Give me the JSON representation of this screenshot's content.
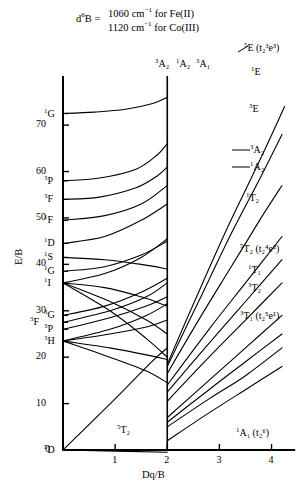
{
  "header": {
    "prefix": "d6B",
    "prefix_super": "6",
    "eq": "=",
    "line1": "1060 cm",
    "line1_sup": "−1",
    "line1_tail": " for Fe(II)",
    "line2": "1120 cm",
    "line2_sup": "−1",
    "line2_tail": " for Co(III)"
  },
  "axes": {
    "ylabel": "E/B",
    "xlabel": "Dq/B",
    "yticks": [
      0,
      10,
      20,
      30,
      40,
      50,
      60,
      70
    ],
    "ytick_labels": [
      "0",
      "10",
      "20",
      "30",
      "40",
      "50",
      "60",
      "70"
    ],
    "xticks": [
      1,
      2,
      3,
      4
    ],
    "xtick_labels": [
      "1",
      "2",
      "3",
      "4"
    ],
    "ylim": [
      0,
      78
    ],
    "xlim": [
      0,
      4.45
    ],
    "crossover_x": 2.0,
    "grid": false
  },
  "free_ion_terms": [
    {
      "label": "1G",
      "super": "1",
      "letter": "G",
      "value": 72.5
    },
    {
      "label": "3P",
      "super": "3",
      "letter": "P",
      "value": 58.0
    },
    {
      "label": "3F",
      "super": "3",
      "letter": "F",
      "value": 54.0
    },
    {
      "label": "1F",
      "super": "1",
      "letter": "F",
      "value": 49.5
    },
    {
      "label": "1D",
      "super": "1",
      "letter": "D",
      "value": 44.5
    },
    {
      "label": "1S",
      "super": "1",
      "letter": "S",
      "value": 41.5
    },
    {
      "label": "1G",
      "super": "1",
      "letter": "G",
      "value": 38.5
    },
    {
      "label": "1I",
      "super": "1",
      "letter": "I",
      "value": 36.0
    },
    {
      "label": "3G",
      "super": "3",
      "letter": "G",
      "value": 29.0
    },
    {
      "label": "3F",
      "super": "3",
      "letter": "F",
      "value": 27.5
    },
    {
      "label": "3P",
      "super": "3",
      "letter": "P",
      "value": 26.0
    },
    {
      "label": "3H",
      "super": "3",
      "letter": "H",
      "value": 23.5
    },
    {
      "label": "5D",
      "super": "5",
      "letter": "D",
      "value": 0.0
    }
  ],
  "state_labels": [
    {
      "name": "5E-high",
      "super": "5",
      "core": "E",
      "config": " (t₂³e³)",
      "x": 244,
      "y": 42
    },
    {
      "name": "1E",
      "super": "1",
      "core": "E",
      "config": "",
      "x": 251,
      "y": 66
    },
    {
      "name": "3E",
      "super": "3",
      "core": "E",
      "config": "",
      "x": 249,
      "y": 103
    },
    {
      "name": "3A2-right",
      "super": "3",
      "core": "A₂",
      "config": "",
      "x": 250,
      "y": 144
    },
    {
      "name": "1A2-right",
      "super": "1",
      "core": "A₂",
      "config": "",
      "x": 250,
      "y": 161
    },
    {
      "name": "1T2",
      "super": "1",
      "core": "T₂",
      "config": "",
      "x": 246,
      "y": 192
    },
    {
      "name": "5T2-high",
      "super": "5",
      "core": "T₂",
      "config": " (t₂⁴e²)",
      "x": 240,
      "y": 243
    },
    {
      "name": "1T1",
      "super": "1",
      "core": "T₁",
      "config": "",
      "x": 248,
      "y": 264
    },
    {
      "name": "3T2",
      "super": "3",
      "core": "T₂",
      "config": "",
      "x": 248,
      "y": 282
    },
    {
      "name": "3T1-high",
      "super": "3",
      "core": "T₁",
      "config": " (t₂⁵e¹)",
      "x": 240,
      "y": 310
    },
    {
      "name": "1A1-ground",
      "super": "1",
      "core": "A₁",
      "config": " (t₂⁶)",
      "x": 236,
      "y": 427
    },
    {
      "name": "3A2-top",
      "super": "3",
      "core": "A₂",
      "config": "",
      "x": 155,
      "y": 58
    },
    {
      "name": "1A2-top",
      "super": "1",
      "core": "A₂",
      "config": "",
      "x": 176,
      "y": 58
    },
    {
      "name": "3A1-top",
      "super": "3",
      "core": "A₁",
      "config": "",
      "x": 196,
      "y": 58
    },
    {
      "name": "5T2-ground",
      "super": "5",
      "core": "T₂",
      "config": "",
      "x": 117,
      "y": 424
    }
  ],
  "chart_data": {
    "type": "line",
    "xlabel": "Dq/B",
    "ylabel": "E/B",
    "xlim": [
      0,
      4.45
    ],
    "ylim": [
      0,
      78
    ],
    "crossover": 2.0,
    "series": [
      {
        "name": "5T2 (ground, low field)",
        "points": [
          [
            0,
            0
          ],
          [
            2.0,
            -0.5
          ]
        ],
        "note": "ground state below crossover, drawn to baseline"
      },
      {
        "name": "5T2-lower-branch",
        "points": [
          [
            0,
            0
          ],
          [
            2.0,
            0
          ]
        ]
      },
      {
        "name": "5E (t2^3 e^3)",
        "points": [
          [
            2.0,
            18.5
          ],
          [
            2.6,
            34
          ],
          [
            3.2,
            49
          ],
          [
            3.8,
            63
          ],
          [
            4.25,
            74
          ]
        ]
      },
      {
        "name": "1E",
        "points": [
          [
            2.0,
            18.0
          ],
          [
            2.6,
            32
          ],
          [
            3.2,
            46
          ],
          [
            3.8,
            59
          ],
          [
            4.2,
            68
          ]
        ]
      },
      {
        "name": "3E",
        "points": [
          [
            2.0,
            16.5
          ],
          [
            2.6,
            28
          ],
          [
            3.2,
            39
          ],
          [
            3.8,
            50
          ],
          [
            4.2,
            57
          ]
        ]
      },
      {
        "name": "3A2-right",
        "points": [
          [
            2.0,
            14.0
          ],
          [
            2.8,
            26
          ],
          [
            3.5,
            36
          ],
          [
            4.2,
            46
          ]
        ]
      },
      {
        "name": "1A2-right",
        "points": [
          [
            2.0,
            12.5
          ],
          [
            2.8,
            23
          ],
          [
            3.5,
            32
          ],
          [
            4.2,
            41
          ]
        ]
      },
      {
        "name": "1T2",
        "points": [
          [
            2.0,
            10.5
          ],
          [
            2.8,
            20
          ],
          [
            3.5,
            28
          ],
          [
            4.2,
            36
          ]
        ]
      },
      {
        "name": "5T2 (t2^4 e^2)",
        "points": [
          [
            2.0,
            7.0
          ],
          [
            2.8,
            15
          ],
          [
            3.5,
            22
          ],
          [
            4.2,
            29
          ]
        ]
      },
      {
        "name": "1T1",
        "points": [
          [
            2.0,
            6.0
          ],
          [
            2.8,
            13
          ],
          [
            3.5,
            19
          ],
          [
            4.2,
            25
          ]
        ]
      },
      {
        "name": "3T2",
        "points": [
          [
            2.0,
            5.0
          ],
          [
            2.8,
            11
          ],
          [
            3.5,
            16
          ],
          [
            4.2,
            22
          ]
        ]
      },
      {
        "name": "3T1 (t2^5 e^1)",
        "points": [
          [
            2.0,
            2.0
          ],
          [
            2.8,
            8
          ],
          [
            3.5,
            13
          ],
          [
            4.2,
            18
          ]
        ]
      },
      {
        "name": "1A1 (t2^6) ground",
        "points": [
          [
            2.0,
            0
          ],
          [
            4.45,
            0
          ]
        ]
      },
      {
        "name": "1G-upper",
        "points": [
          [
            0,
            72.5
          ],
          [
            0.6,
            72.8
          ],
          [
            1.2,
            73.4
          ],
          [
            1.7,
            74.6
          ],
          [
            2.0,
            76
          ]
        ]
      },
      {
        "name": "3P-branch",
        "points": [
          [
            0,
            58
          ],
          [
            0.7,
            58.6
          ],
          [
            1.4,
            60.5
          ],
          [
            1.8,
            63.5
          ],
          [
            2.0,
            66
          ]
        ]
      },
      {
        "name": "3F-branch",
        "points": [
          [
            0,
            54
          ],
          [
            0.7,
            54.5
          ],
          [
            1.4,
            56.5
          ],
          [
            1.8,
            59
          ],
          [
            2.0,
            61
          ]
        ]
      },
      {
        "name": "1F-branch",
        "points": [
          [
            0,
            49.5
          ],
          [
            0.8,
            50.5
          ],
          [
            1.5,
            53
          ],
          [
            2.0,
            57
          ]
        ]
      },
      {
        "name": "1D-branch",
        "points": [
          [
            0,
            44.5
          ],
          [
            0.8,
            46
          ],
          [
            1.5,
            49.5
          ],
          [
            2.0,
            53
          ]
        ]
      },
      {
        "name": "1S-branch",
        "points": [
          [
            0,
            41.5
          ],
          [
            0.8,
            41
          ],
          [
            1.5,
            40
          ],
          [
            2.0,
            39
          ]
        ]
      },
      {
        "name": "1G-lower",
        "points": [
          [
            0,
            38.5
          ],
          [
            0.8,
            39.5
          ],
          [
            1.5,
            42
          ],
          [
            2.0,
            45
          ]
        ]
      },
      {
        "name": "1I-a",
        "points": [
          [
            0,
            36
          ],
          [
            0.8,
            38
          ],
          [
            1.5,
            41.5
          ],
          [
            2.0,
            45.5
          ]
        ]
      },
      {
        "name": "1I-b",
        "points": [
          [
            0,
            36
          ],
          [
            0.8,
            35
          ],
          [
            1.5,
            33
          ],
          [
            2.0,
            31
          ]
        ]
      },
      {
        "name": "1I-c",
        "points": [
          [
            0,
            36
          ],
          [
            0.9,
            32
          ],
          [
            1.6,
            28
          ],
          [
            2.0,
            25
          ]
        ]
      },
      {
        "name": "1I-d",
        "points": [
          [
            0,
            36
          ],
          [
            0.9,
            30
          ],
          [
            1.6,
            24
          ],
          [
            2.0,
            20
          ]
        ]
      },
      {
        "name": "3G-branch",
        "points": [
          [
            0,
            29
          ],
          [
            0.8,
            31
          ],
          [
            1.5,
            34
          ],
          [
            2.0,
            37
          ]
        ]
      },
      {
        "name": "3F-lower",
        "points": [
          [
            0,
            27.5
          ],
          [
            0.9,
            30
          ],
          [
            1.6,
            33
          ],
          [
            2.0,
            36
          ]
        ]
      },
      {
        "name": "3P-lower",
        "points": [
          [
            0,
            26
          ],
          [
            0.9,
            28.5
          ],
          [
            1.6,
            31
          ],
          [
            2.0,
            33
          ]
        ]
      },
      {
        "name": "3H-a",
        "points": [
          [
            0,
            23.5
          ],
          [
            0.9,
            26
          ],
          [
            1.6,
            29
          ],
          [
            2.0,
            31.5
          ]
        ]
      },
      {
        "name": "3H-b",
        "points": [
          [
            0,
            23.5
          ],
          [
            0.9,
            25
          ],
          [
            1.6,
            26.5
          ],
          [
            2.0,
            28
          ]
        ]
      },
      {
        "name": "3H-c",
        "points": [
          [
            0,
            23.5
          ],
          [
            0.9,
            22
          ],
          [
            1.6,
            20.5
          ],
          [
            2.0,
            19.5
          ]
        ]
      },
      {
        "name": "3H-d",
        "points": [
          [
            0,
            23.5
          ],
          [
            0.9,
            20
          ],
          [
            1.6,
            17
          ],
          [
            2.0,
            14.5
          ]
        ]
      },
      {
        "name": "5D-rise",
        "points": [
          [
            0,
            0
          ],
          [
            1.0,
            11
          ],
          [
            1.7,
            19
          ],
          [
            2.0,
            22
          ]
        ]
      }
    ]
  }
}
